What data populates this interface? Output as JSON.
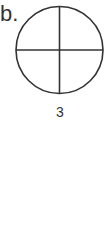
{
  "figure": {
    "label": "b.",
    "caption": "3",
    "shape": "circle",
    "divisions": 4,
    "stroke_color": "#333333"
  }
}
